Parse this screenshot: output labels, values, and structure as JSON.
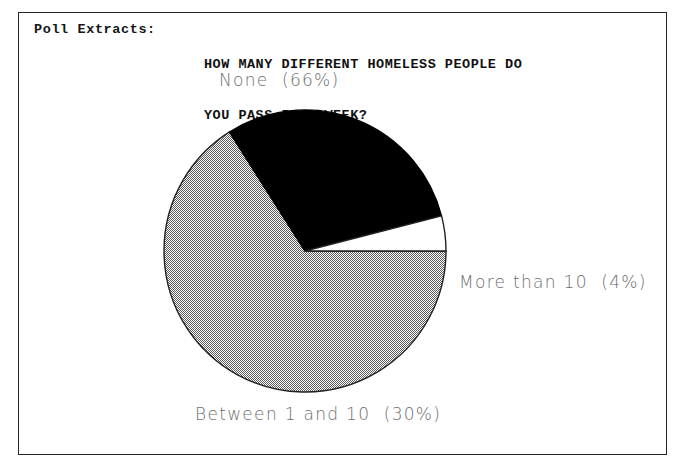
{
  "page": {
    "background_color": "#ffffff",
    "frame_color": "#252525"
  },
  "header": {
    "source_label": "Poll Extracts:",
    "title_line_1": "HOW MANY DIFFERENT HOMELESS PEOPLE DO",
    "title_line_2": "YOU PASS IN A WEEK?"
  },
  "labels": {
    "none": "None  (66%)",
    "more_than_10": "More than 10  (4%)",
    "between_1_and_10": "Between 1 and 10  (30%)"
  },
  "chart_data": {
    "type": "pie",
    "title": "HOW MANY DIFFERENT HOMELESS PEOPLE DO YOU PASS IN A WEEK?",
    "subtitle": "Poll Extracts:",
    "categories": [
      "None",
      "Between 1 and 10",
      "More than 10"
    ],
    "values": [
      66,
      30,
      4
    ],
    "value_unit": "percent",
    "labels": [
      "None  (66%)",
      "Between 1 and 10  (30%)",
      "More than 10  (4%)"
    ],
    "slice_fills": [
      "gray-dither-hatch",
      "solid-black",
      "white"
    ],
    "slice_colors": [
      "#9a9a9a",
      "#000000",
      "#ffffff"
    ],
    "outline_color": "#222222",
    "legend": "none",
    "legend_position": "labels-outside",
    "grid": false,
    "start_angle_deg": 0,
    "direction": "clockwise",
    "center_px": [
      305,
      251
    ],
    "radius_px": 141
  }
}
